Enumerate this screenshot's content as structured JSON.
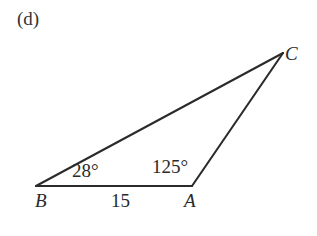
{
  "figure": {
    "part_label": "(d)",
    "background_color": "#ffffff",
    "stroke_color": "#2b2b2b",
    "stroke_width": 2.1,
    "shape": "triangle",
    "vertices": [
      {
        "name": "B",
        "label": "B",
        "x": 36,
        "y": 186
      },
      {
        "name": "A",
        "label": "A",
        "x": 192,
        "y": 186
      },
      {
        "name": "C",
        "label": "C",
        "x": 283,
        "y": 53
      }
    ],
    "edges": [
      {
        "name": "side-ba",
        "from": "B",
        "to": "A"
      },
      {
        "name": "side-bc",
        "from": "B",
        "to": "C"
      },
      {
        "name": "side-ac",
        "from": "A",
        "to": "C"
      }
    ],
    "angles": [
      {
        "name": "angle-b",
        "at_vertex": "B",
        "label": "28°",
        "value": 28,
        "unit": "degrees"
      },
      {
        "name": "angle-a",
        "at_vertex": "A",
        "label": "125°",
        "value": 125,
        "unit": "degrees"
      }
    ],
    "side_lengths": [
      {
        "name": "side-ab-length",
        "edge": "side-ba",
        "label": "15",
        "value": 15
      }
    ]
  }
}
